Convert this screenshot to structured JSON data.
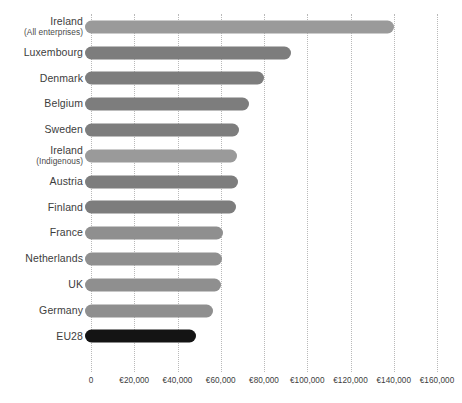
{
  "chart_data": {
    "type": "bar",
    "orientation": "horizontal",
    "title": "",
    "subtitle": "",
    "xlabel": "",
    "ylabel": "",
    "grid": true,
    "legend": "none",
    "xlim": [
      0,
      160000
    ],
    "xtick_step": 20000,
    "currency_symbol": "€",
    "tick_labels": [
      "0",
      "€20,000",
      "€40,000",
      "€60,000",
      "€80,000",
      "€100,000",
      "€120,000",
      "€140,000",
      "€160,000"
    ],
    "tick_values": [
      0,
      20000,
      40000,
      60000,
      80000,
      100000,
      120000,
      140000,
      160000
    ],
    "categories": [
      "Ireland (All enterprises)",
      "Luxembourg",
      "Denmark",
      "Belgium",
      "Sweden",
      "Ireland (Indigenous)",
      "Austria",
      "Finland",
      "France",
      "Netherlands",
      "UK",
      "Germany",
      "EU28"
    ],
    "values": [
      140000,
      92500,
      80000,
      73000,
      68500,
      67400,
      68000,
      67000,
      61000,
      60500,
      60000,
      56500,
      48700
    ],
    "bars": [
      {
        "label_main": "Ireland",
        "label_sub": "(All enterprises)",
        "value": 140000,
        "color": "#9a9a9a",
        "highlight": true
      },
      {
        "label_main": "Luxembourg",
        "label_sub": "",
        "value": 92500,
        "color": "#7d7d7d",
        "highlight": false
      },
      {
        "label_main": "Denmark",
        "label_sub": "",
        "value": 80000,
        "color": "#7d7d7d",
        "highlight": false
      },
      {
        "label_main": "Belgium",
        "label_sub": "",
        "value": 73000,
        "color": "#7d7d7d",
        "highlight": false
      },
      {
        "label_main": "Sweden",
        "label_sub": "",
        "value": 68500,
        "color": "#7d7d7d",
        "highlight": false
      },
      {
        "label_main": "Ireland",
        "label_sub": "(Indigenous)",
        "value": 67400,
        "color": "#9a9a9a",
        "highlight": true
      },
      {
        "label_main": "Austria",
        "label_sub": "",
        "value": 68000,
        "color": "#7d7d7d",
        "highlight": false
      },
      {
        "label_main": "Finland",
        "label_sub": "",
        "value": 67000,
        "color": "#7d7d7d",
        "highlight": false
      },
      {
        "label_main": "France",
        "label_sub": "",
        "value": 61000,
        "color": "#8f8f8f",
        "highlight": false
      },
      {
        "label_main": "Netherlands",
        "label_sub": "",
        "value": 60500,
        "color": "#8f8f8f",
        "highlight": false
      },
      {
        "label_main": "UK",
        "label_sub": "",
        "value": 60000,
        "color": "#8f8f8f",
        "highlight": false
      },
      {
        "label_main": "Germany",
        "label_sub": "",
        "value": 56500,
        "color": "#8f8f8f",
        "highlight": false
      },
      {
        "label_main": "EU28",
        "label_sub": "",
        "value": 48700,
        "color": "#141414",
        "highlight": false
      }
    ],
    "colors": {
      "bar_default": "#7d7d7d",
      "bar_light": "#8f8f8f",
      "bar_ireland": "#9a9a9a",
      "bar_eu28": "#141414",
      "gridline": "#b9b9b9",
      "text": "#3d3d3d",
      "background": "#ffffff"
    }
  }
}
